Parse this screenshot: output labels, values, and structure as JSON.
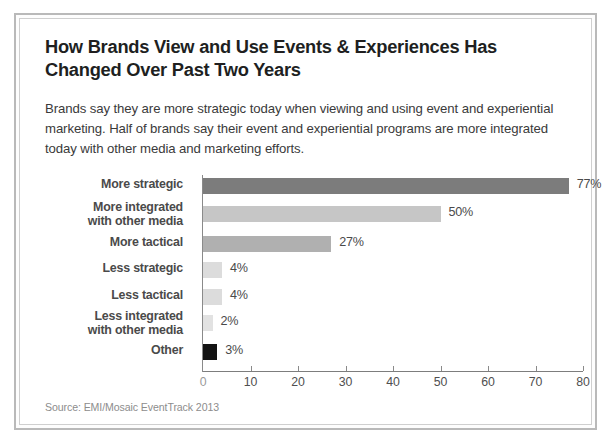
{
  "card": {
    "title": "How Brands View and Use Events & Experiences Has Changed Over Past Two Years",
    "intro": "Brands say they are more strategic today when viewing and using event and experiential marketing. Half of brands say their event and experiential programs are more integrated today with other media and marketing efforts.",
    "source": "Source: EMI/Mosaic EventTrack 2013"
  },
  "chart_data": {
    "type": "bar",
    "orientation": "horizontal",
    "title": "How Brands View and Use Events & Experiences Has Changed Over Past Two Years",
    "xlabel": "",
    "ylabel": "",
    "xlim": [
      0,
      80
    ],
    "xticks": [
      0,
      10,
      20,
      30,
      40,
      50,
      60,
      70,
      80
    ],
    "xtick_labels": [
      "0",
      "10",
      "20",
      "30",
      "40",
      "50",
      "60",
      "70",
      "80"
    ],
    "grid": false,
    "legend": "none",
    "value_suffix": "%",
    "categories": [
      "More strategic",
      "More integrated with other media",
      "More tactical",
      "Less strategic",
      "Less tactical",
      "Less integrated with other media",
      "Other"
    ],
    "values": [
      77,
      50,
      27,
      4,
      4,
      2,
      3
    ],
    "value_labels": [
      "77%",
      "50%",
      "27%",
      "4%",
      "4%",
      "2%",
      "3%"
    ],
    "bars": [
      {
        "label_line1": "More strategic",
        "label_line2": "",
        "value": 77,
        "value_label": "77%",
        "color": "#7c7c7c"
      },
      {
        "label_line1": "More integrated",
        "label_line2": "with other media",
        "value": 50,
        "value_label": "50%",
        "color": "#c6c6c6"
      },
      {
        "label_line1": "More tactical",
        "label_line2": "",
        "value": 27,
        "value_label": "27%",
        "color": "#b0b0b0"
      },
      {
        "label_line1": "Less strategic",
        "label_line2": "",
        "value": 4,
        "value_label": "4%",
        "color": "#dcdcdc"
      },
      {
        "label_line1": "Less tactical",
        "label_line2": "",
        "value": 4,
        "value_label": "4%",
        "color": "#dcdcdc"
      },
      {
        "label_line1": "Less integrated",
        "label_line2": "with other media",
        "value": 2,
        "value_label": "2%",
        "color": "#e2e2e2"
      },
      {
        "label_line1": "Other",
        "label_line2": "",
        "value": 3,
        "value_label": "3%",
        "color": "#131313"
      }
    ],
    "colors": {
      "dark_gray": "#7c7c7c",
      "medium_gray": "#b0b0b0",
      "light_gray": "#c6c6c6",
      "pale_gray": "#dcdcdc",
      "black": "#131313",
      "axis": "#8a8a8a",
      "text": "#4a4a4a"
    }
  }
}
